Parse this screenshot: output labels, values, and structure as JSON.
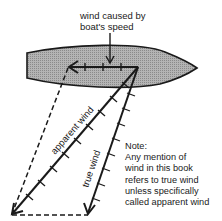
{
  "diagram": {
    "labels": {
      "boat_speed_wind_line1": "wind caused by",
      "boat_speed_wind_line2": "boat's speed",
      "apparent_wind": "apparent wind",
      "true_wind": "true wind"
    },
    "note": {
      "heading": "Note:",
      "lines": [
        "Any mention of",
        "wind in this book",
        "refers to true wind",
        "unless specifically",
        "called apparent wind"
      ]
    },
    "colors": {
      "boat_fill": "#a8a8a8",
      "line": "#1a1a1a",
      "background": "#ffffff"
    }
  }
}
